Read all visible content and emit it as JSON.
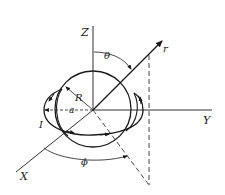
{
  "diagram": {
    "type": "physics-coordinate-figure",
    "labels": {
      "z_axis": "Z",
      "y_axis": "Y",
      "x_axis": "X",
      "radial": "r",
      "polar_angle": "θ",
      "azimuth_angle": "ϕ",
      "sphere_radius": "R",
      "loop_radius": "a",
      "current": "I"
    },
    "colors": {
      "ink": "#1a1a1a",
      "background": "#ffffff"
    }
  }
}
